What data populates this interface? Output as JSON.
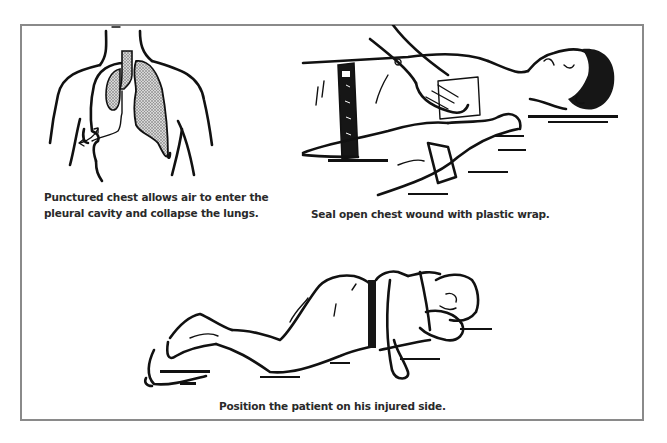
{
  "figure": {
    "panels": [
      {
        "id": "lung-diagram",
        "caption_lines": [
          "Punctured chest allows air to enter the",
          "pleural cavity and collapse the lungs."
        ]
      },
      {
        "id": "seal-wound",
        "caption": "Seal open chest wound with plastic wrap."
      },
      {
        "id": "recovery-position",
        "caption": "Position the patient on his injured side."
      }
    ],
    "colors": {
      "frame_border": "#8a8a8a",
      "ink": "#111111",
      "caption_text": "#2a2a2a",
      "lung_fill": "#b8b8b8"
    }
  }
}
